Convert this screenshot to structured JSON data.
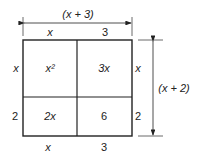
{
  "diagram": {
    "top_dimension": "(x + 3)",
    "right_dimension": "(x + 2)",
    "top_labels": [
      "x",
      "3"
    ],
    "bottom_labels": [
      "x",
      "3"
    ],
    "left_labels": [
      "x",
      "2"
    ],
    "right_labels": [
      "x",
      "2"
    ],
    "cells": {
      "top_left": "x²",
      "top_right": "3x",
      "bottom_left": "2x",
      "bottom_right": "6"
    },
    "colors": {
      "stroke": "#222222",
      "background": "#ffffff"
    }
  }
}
